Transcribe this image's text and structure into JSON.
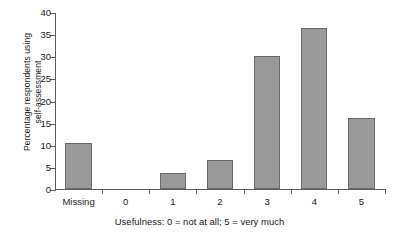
{
  "chart_data": {
    "type": "bar",
    "title": "",
    "xlabel": "Usefulness: 0 = not at all; 5 = very much",
    "ylabel_lines": [
      "Percentage respondents using",
      "self-assessment"
    ],
    "ylabel": "Percentage respondents using self-assessment",
    "categories": [
      "Missing",
      "0",
      "1",
      "2",
      "3",
      "4",
      "5"
    ],
    "values": [
      10.3,
      0,
      3.7,
      6.6,
      30.1,
      36.3,
      16.1
    ],
    "ylim": [
      0,
      40
    ],
    "ytick_labels": [
      "0",
      "5",
      "10",
      "15",
      "20",
      "25",
      "30",
      "35",
      "40"
    ],
    "ytick_values": [
      0,
      5,
      10,
      15,
      20,
      25,
      30,
      35,
      40
    ],
    "grid": false,
    "legend": null,
    "bar_fill_color": "#9a9a9a",
    "bar_edge_color": "#6a6a6a",
    "axis_color": "#5d5d5d",
    "background_color": "#ffffff"
  }
}
